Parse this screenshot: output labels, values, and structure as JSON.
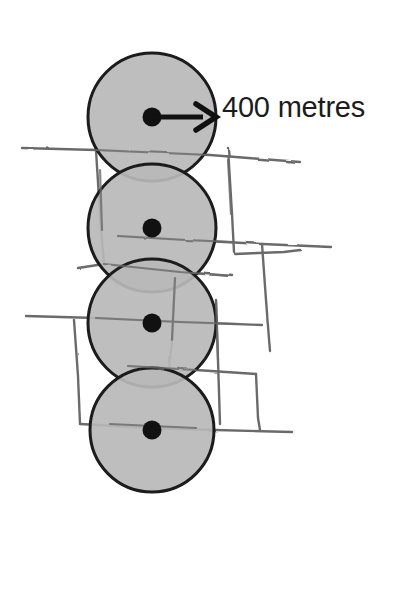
{
  "diagram": {
    "type": "annotated-sketch-diagram",
    "canvas": {
      "width": 398,
      "height": 608,
      "background": "#ffffff"
    },
    "annotation": {
      "radius_label": "400 metres",
      "label_color": "#1c1c1c",
      "label_font_size_px": 29,
      "label_position": {
        "x": 222,
        "y": 90
      }
    },
    "arrow": {
      "name": "radius-arrow",
      "from": {
        "x": 152,
        "y": 117
      },
      "to": {
        "x": 215,
        "y": 117
      },
      "color": "#111111",
      "stroke_width": 5,
      "head_length": 18,
      "head_half_width": 11,
      "meaning": "radius of circle equals 400 metres"
    },
    "circles": {
      "name": "catchment-circles",
      "count": 4,
      "fill_color": "#b9b9b9",
      "fill_opacity": 0.95,
      "stroke_color": "#1a1a1a",
      "stroke_width": 3,
      "radius_px": 64,
      "items": [
        {
          "label": "catchment-circle-1",
          "cx": 152,
          "cy": 117,
          "r": 64
        },
        {
          "label": "catchment-circle-2",
          "cx": 152,
          "cy": 228,
          "r": 64
        },
        {
          "label": "catchment-circle-3",
          "cx": 152,
          "cy": 323,
          "r": 64
        },
        {
          "label": "catchment-circle-4",
          "cx": 152,
          "cy": 430,
          "r": 62
        }
      ]
    },
    "centre_dots": {
      "name": "circle-centre-dots",
      "color": "#111111",
      "radius_px": 9,
      "items": [
        {
          "label": "centre-dot-1",
          "cx": 152,
          "cy": 117
        },
        {
          "label": "centre-dot-2",
          "cx": 152,
          "cy": 228
        },
        {
          "label": "centre-dot-3",
          "cx": 152,
          "cy": 323
        },
        {
          "label": "centre-dot-4",
          "cx": 152,
          "cy": 430
        }
      ]
    },
    "axis_line": {
      "name": "corridor-centre-line",
      "color": "#6e6e6e",
      "stroke_width": 2,
      "from": {
        "x": 152,
        "y": 8
      },
      "to": {
        "x": 152,
        "y": 590
      }
    },
    "sketch_lines": {
      "name": "street-grid-sketch",
      "color": "#6b6b6b",
      "stroke_width": 2.4,
      "style": "hand-drawn",
      "paths": [
        "M 22 148 L 96 150 L 210 155 L 300 162",
        "M 96 150 L 100 216 L 104 264",
        "M 104 264 L 78 268",
        "M 104 264 L 180 272 L 232 276",
        "M 175 278 L 172 340 L 168 382",
        "M 228 148 L 232 214 L 234 252",
        "M 118 236 L 186 240 L 262 244 L 332 247",
        "M 262 244 L 266 300 L 270 352",
        "M 235 254 L 284 252 L 300 250",
        "M 26 316 L 96 318 L 180 322 L 262 325",
        "M 74 320 L 78 376 L 80 424",
        "M 80 424 L 152 428 L 216 430 L 292 432",
        "M 216 300 L 218 360 L 220 424",
        "M 128 366 L 196 370 L 256 374",
        "M 256 374 L 258 418 L 260 430"
      ]
    }
  }
}
